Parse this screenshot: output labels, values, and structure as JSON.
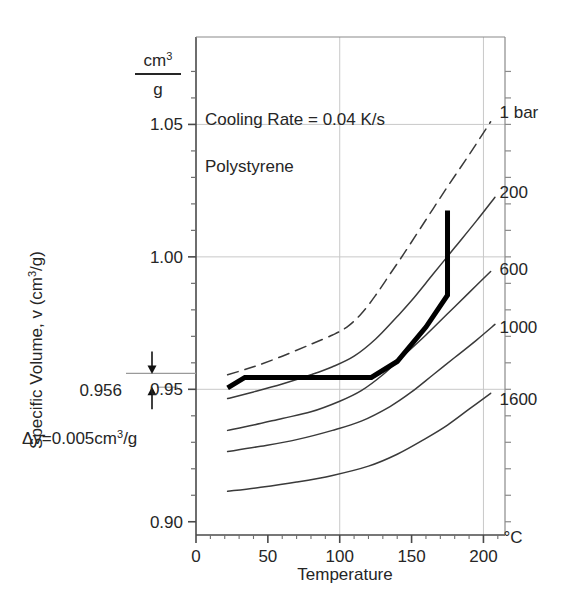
{
  "figure": {
    "title": "",
    "background_color": "#ffffff",
    "axis_color": "#6e6e6e",
    "grid_color": "#c8c8c8",
    "curve_color": "#3a3a3a",
    "highlight_color": "#000000"
  },
  "annotations": {
    "cooling_rate": "Cooling Rate = 0.04 K/s",
    "material": "Polystyrene",
    "delta_v_prefix": "Δv=0.005cm",
    "delta_v_sup": "3",
    "delta_v_suffix": "/g",
    "delta_v_full": "Δv=0.005cm3/g",
    "marker_value": "0.956",
    "unit_numerator": "cm",
    "unit_numerator_sup": "3",
    "unit_denominator": "g",
    "x_unit": "°C"
  },
  "axes": {
    "x_title": "Temperature",
    "y_title_main": "Specific Volume, v (cm",
    "y_title_sup": "3",
    "y_title_tail": "/g)",
    "y_title_full": "Specific Volume, v (cm3/g)",
    "x_ticks": [
      "0",
      "50",
      "100",
      "150",
      "200"
    ],
    "y_ticks": [
      "1.05",
      "1.00",
      "0.95",
      "0.90"
    ],
    "x_range": [
      0,
      215
    ],
    "y_range": [
      0.895,
      1.083
    ],
    "x_major": [
      0,
      50,
      100,
      150,
      200
    ],
    "y_major": [
      1.05,
      1.0,
      0.95,
      0.9
    ],
    "x_minor_step": 10,
    "y_minor_step": 0.01,
    "grid_vertical_at": [
      100,
      200
    ],
    "grid_horizontal_at": [
      1.05,
      1.0,
      0.95
    ]
  },
  "chart_data": {
    "type": "line",
    "title": "",
    "subtitle": "Cooling Rate = 0.04 K/s — Polystyrene",
    "xlabel": "Temperature",
    "ylabel": "Specific Volume, v (cm3/g)",
    "xunit": "°C",
    "yunit": "cm3/g",
    "xlim": [
      0,
      215
    ],
    "ylim": [
      0.895,
      1.083
    ],
    "grid": true,
    "legend": "right-inline-curve-labels",
    "series": [
      {
        "name": "1 bar",
        "label": "1 bar",
        "pressure_bar": 1,
        "style": "dashed",
        "weight": "thin",
        "x": [
          22,
          40,
          60,
          80,
          95,
          105,
          115,
          125,
          135,
          145,
          160,
          175,
          190,
          205
        ],
        "y": [
          0.9555,
          0.9585,
          0.9625,
          0.967,
          0.9705,
          0.9735,
          0.9785,
          0.9855,
          0.9935,
          1.0015,
          1.014,
          1.0265,
          1.0385,
          1.051
        ]
      },
      {
        "name": "200",
        "label": "200",
        "pressure_bar": 200,
        "style": "solid",
        "weight": "thin",
        "x": [
          22,
          40,
          60,
          80,
          95,
          110,
          125,
          140,
          150,
          165,
          180,
          195,
          208
        ],
        "y": [
          0.9465,
          0.949,
          0.952,
          0.9555,
          0.9585,
          0.9625,
          0.969,
          0.9775,
          0.9835,
          0.9935,
          1.0035,
          1.0135,
          1.0225
        ]
      },
      {
        "name": "600",
        "label": "600",
        "pressure_bar": 600,
        "style": "solid",
        "weight": "thin",
        "x": [
          22,
          40,
          60,
          80,
          100,
          115,
          130,
          145,
          160,
          175,
          190,
          205
        ],
        "y": [
          0.9345,
          0.9365,
          0.939,
          0.9415,
          0.9455,
          0.9495,
          0.9555,
          0.963,
          0.9705,
          0.9785,
          0.9865,
          0.9945
        ]
      },
      {
        "name": "1000",
        "label": "1000",
        "pressure_bar": 1000,
        "style": "solid",
        "weight": "thin",
        "x": [
          22,
          45,
          70,
          95,
          115,
          135,
          150,
          165,
          180,
          195,
          208
        ],
        "y": [
          0.9265,
          0.9285,
          0.931,
          0.9345,
          0.938,
          0.9435,
          0.949,
          0.9555,
          0.962,
          0.9685,
          0.9745
        ]
      },
      {
        "name": "1600",
        "label": "1600",
        "pressure_bar": 1600,
        "style": "solid",
        "weight": "thin",
        "x": [
          22,
          45,
          70,
          95,
          120,
          140,
          160,
          175,
          190,
          205
        ],
        "y": [
          0.9115,
          0.913,
          0.915,
          0.9175,
          0.921,
          0.9255,
          0.9315,
          0.9365,
          0.9425,
          0.9485
        ]
      },
      {
        "name": "process-path",
        "label": "",
        "style": "solid",
        "weight": "bold",
        "description": "Bold processing path: isobaric/isochoric segments",
        "x": [
          22,
          34,
          122,
          140,
          160,
          175,
          175
        ],
        "y": [
          0.9505,
          0.9545,
          0.9545,
          0.9605,
          0.9735,
          0.9855,
          1.0175
        ]
      }
    ],
    "markers": [
      {
        "name": "delta-v-bracket",
        "label": "Δv=0.005cm3/g",
        "value_top": 0.956,
        "value_bottom": 0.951,
        "delta": 0.005
      }
    ]
  },
  "curve_labels": [
    {
      "text": "1 bar",
      "x": 207,
      "y": 1.0545
    },
    {
      "text": "200",
      "x": 207,
      "y": 1.0245
    },
    {
      "text": "600",
      "x": 207,
      "y": 0.9955
    },
    {
      "text": "1000",
      "x": 207,
      "y": 0.9735
    },
    {
      "text": "1600",
      "x": 207,
      "y": 0.9465
    }
  ]
}
